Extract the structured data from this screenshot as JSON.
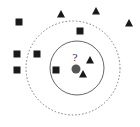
{
  "diagram": {
    "type": "knn-classification",
    "query_label": "?",
    "colors": {
      "background": "#ffffff",
      "marker": "#1a1a1a",
      "query_point": "#555555",
      "solid_circle": "#666666",
      "dashed_circle": "#777777"
    },
    "query_point": {
      "x": 76,
      "y": 69,
      "r": 4.5
    },
    "query_label_pos": {
      "x": 75,
      "y": 61
    },
    "solid_circle": {
      "cx": 77,
      "cy": 68,
      "r": 27,
      "meaning": "k=3 neighborhood"
    },
    "dashed_circle": {
      "cx": 73,
      "cy": 68,
      "r": 47,
      "meaning": "k=5 neighborhood"
    },
    "squares": [
      {
        "x": 19,
        "y": 22
      },
      {
        "x": 80,
        "y": 31
      },
      {
        "x": 17,
        "y": 54
      },
      {
        "x": 37,
        "y": 54
      },
      {
        "x": 17,
        "y": 70
      },
      {
        "x": 56,
        "y": 70
      }
    ],
    "triangles": [
      {
        "x": 61,
        "y": 14
      },
      {
        "x": 96,
        "y": 11
      },
      {
        "x": 129,
        "y": 23
      },
      {
        "x": 90,
        "y": 60
      },
      {
        "x": 83,
        "y": 74
      }
    ]
  }
}
